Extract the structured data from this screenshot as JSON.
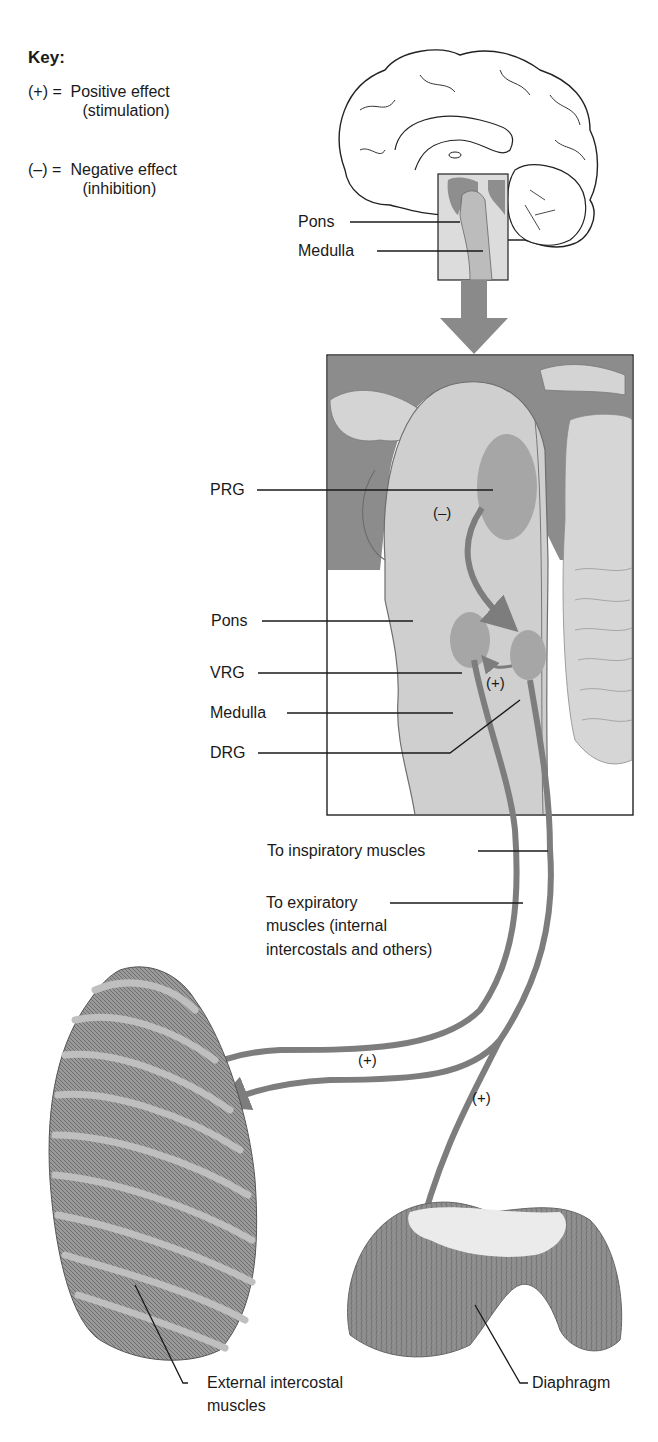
{
  "key": {
    "title": "Key:",
    "items": [
      {
        "symbol": "(+)",
        "equals": "=",
        "label": "Positive effect",
        "sublabel": "(stimulation)"
      },
      {
        "symbol": "(–)",
        "equals": "=",
        "label": "Negative effect",
        "sublabel": "(inhibition)"
      }
    ]
  },
  "brain_overview": {
    "labels": {
      "pons": "Pons",
      "medulla": "Medulla"
    }
  },
  "brainstem_detail": {
    "labels": {
      "prg": "PRG",
      "pons": "Pons",
      "vrg": "VRG",
      "medulla": "Medulla",
      "drg": "DRG"
    },
    "signs": {
      "prg_effect": "(–)",
      "vrg_drg_effect": "(+)"
    }
  },
  "pathways": {
    "inspiratory": "To inspiratory muscles",
    "expiratory_line1": "To expiratory",
    "expiratory_line2": "muscles (internal",
    "expiratory_line3": "intercostals and others)",
    "sign_ribcage": "(+)",
    "sign_diaphragm": "(+)"
  },
  "muscles": {
    "intercostal_line1": "External intercostal",
    "intercostal_line2": "muscles",
    "diaphragm": "Diaphragm"
  },
  "colors": {
    "dark_tissue": "#8a8a8a",
    "light_tissue": "#cfcfcf",
    "nucleus": "#a6a6a6",
    "arrow": "#7d7d7d",
    "line": "#1a1a1a"
  }
}
